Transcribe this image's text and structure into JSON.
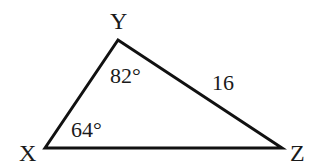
{
  "figure": {
    "type": "triangle",
    "vertices": {
      "X": {
        "label": "X",
        "x": 45,
        "y": 148
      },
      "Y": {
        "label": "Y",
        "x": 118,
        "y": 40
      },
      "Z": {
        "label": "Z",
        "x": 282,
        "y": 148
      }
    },
    "angles": {
      "Y": {
        "label": "82°",
        "value": 82
      },
      "X": {
        "label": "64°",
        "value": 64
      }
    },
    "sides": {
      "YZ": {
        "label": "16",
        "length": 16
      }
    },
    "colors": {
      "stroke": "#111111",
      "text": "#1a1a1a",
      "background": "#ffffff"
    }
  }
}
